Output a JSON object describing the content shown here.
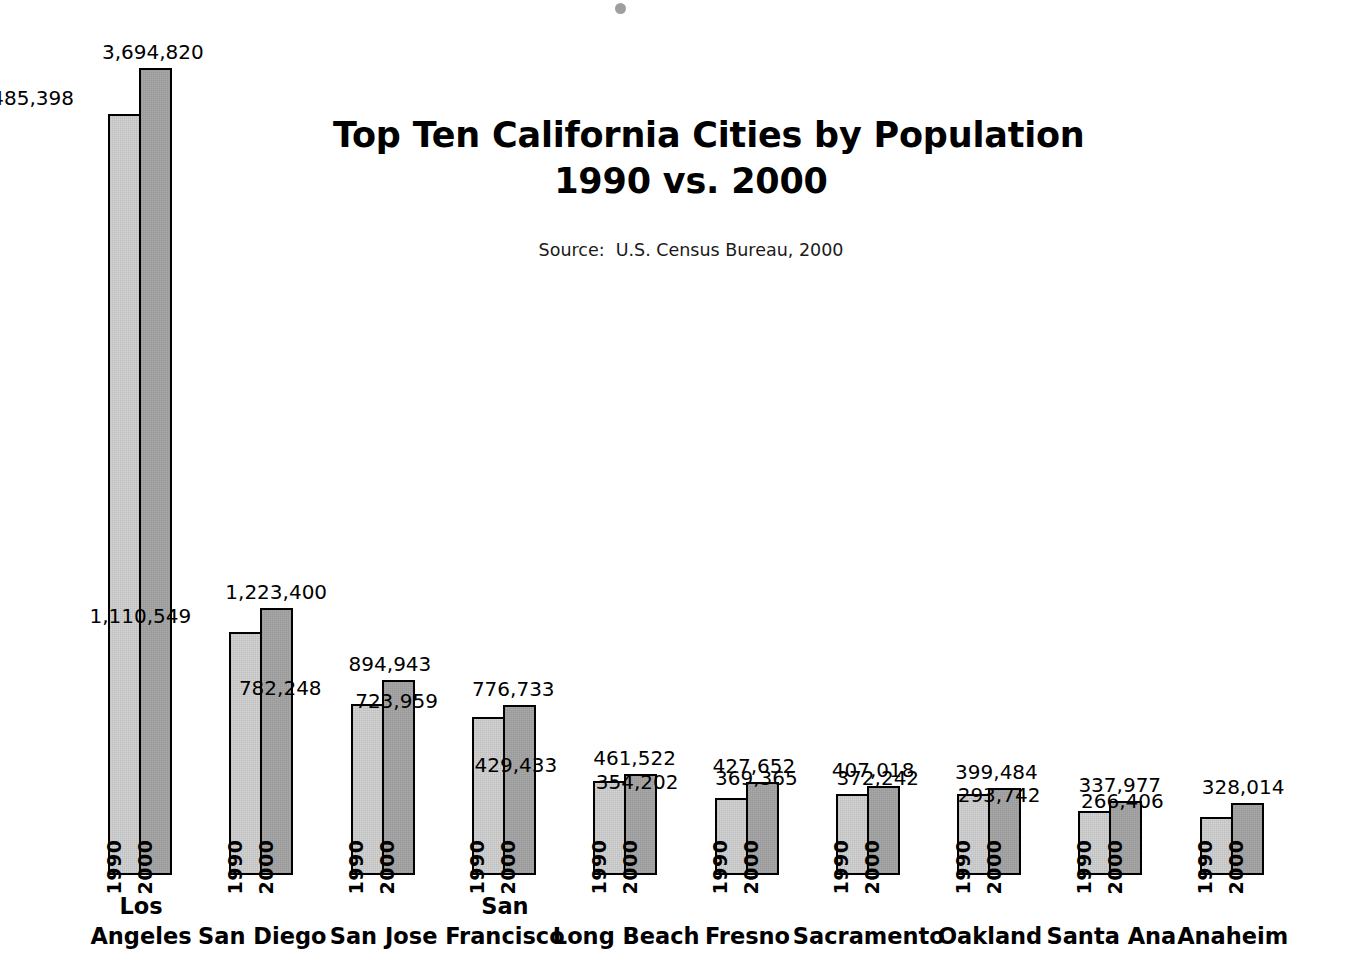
{
  "figure": {
    "title_line1": "Top Ten California Cities by Population",
    "title_line2": "1990 vs. 2000",
    "source": "Source:  U.S. Census Bureau, 2000",
    "background_color": "#ffffff",
    "series_1990_color": "#d4d4d4",
    "series_2000_color": "#a9a9a9",
    "bar_outline_color": "#000000"
  },
  "chart_data": {
    "type": "bar",
    "title": "Top Ten California Cities by Population 1990 vs. 2000",
    "subtitle": "Source:  U.S. Census Bureau, 2000",
    "xlabel": "",
    "ylabel": "",
    "ylim": [
      0,
      3694820
    ],
    "grid": false,
    "legend": "in-bar rotated labels",
    "categories": [
      "Los Angeles",
      "San Diego",
      "San Jose",
      "San Francisco",
      "Long Beach",
      "Fresno",
      "Sacramento",
      "Oakland",
      "Santa Ana",
      "Anaheim"
    ],
    "category_lines": [
      [
        "Los",
        "Angeles"
      ],
      [
        "San Diego"
      ],
      [
        "San Jose"
      ],
      [
        "San",
        "Francisco"
      ],
      [
        "Long Beach"
      ],
      [
        "Fresno"
      ],
      [
        "Sacramento"
      ],
      [
        "Oakland"
      ],
      [
        "Santa Ana"
      ],
      [
        "Anaheim"
      ]
    ],
    "series": [
      {
        "name": "1990",
        "values": [
          3485398,
          1110549,
          782248,
          723959,
          429433,
          354202,
          369365,
          372242,
          293742,
          266406
        ],
        "labels": [
          "3,485,398",
          "1,110,549",
          "782,248",
          "723,959",
          "429,433",
          "354,202",
          "369,365",
          "372,242",
          "293,742",
          "266,406"
        ]
      },
      {
        "name": "2000",
        "values": [
          3694820,
          1223400,
          894943,
          776733,
          461522,
          427652,
          407018,
          399484,
          337977,
          328014
        ],
        "labels": [
          "3,694,820",
          "1,223,400",
          "894,943",
          "776,733",
          "461,522",
          "427,652",
          "407,018",
          "399,484",
          "337,977",
          "328,014"
        ]
      }
    ]
  },
  "groups": [
    {
      "city_line1": "Los",
      "city_line2": "Angeles",
      "label_1990": "3,485,398",
      "label_2000": "3,694,820"
    },
    {
      "city_line1": "San Diego",
      "city_line2": "",
      "label_1990": "1,110,549",
      "label_2000": "1,223,400"
    },
    {
      "city_line1": "San Jose",
      "city_line2": "",
      "label_1990": "782,248",
      "label_2000": "894,943"
    },
    {
      "city_line1": "San",
      "city_line2": "Francisco",
      "label_1990": "723,959",
      "label_2000": "776,733"
    },
    {
      "city_line1": "Long Beach",
      "city_line2": "",
      "label_1990": "429,433",
      "label_2000": "461,522"
    },
    {
      "city_line1": "Fresno",
      "city_line2": "",
      "label_1990": "354,202",
      "label_2000": "427,652"
    },
    {
      "city_line1": "Sacramento",
      "city_line2": "",
      "label_1990": "369,365",
      "label_2000": "407,018"
    },
    {
      "city_line1": "Oakland",
      "city_line2": "",
      "label_1990": "372,242",
      "label_2000": "399,484"
    },
    {
      "city_line1": "Santa Ana",
      "city_line2": "",
      "label_1990": "293,742",
      "label_2000": "337,977"
    },
    {
      "city_line1": "Anaheim",
      "city_line2": "",
      "label_1990": "266,406",
      "label_2000": "328,014"
    }
  ],
  "series_names": {
    "first": "1990",
    "second": "2000"
  }
}
